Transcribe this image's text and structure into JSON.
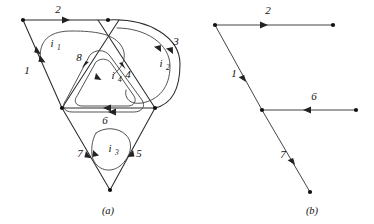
{
  "figure": {
    "panels": [
      {
        "id": "a",
        "caption": "(a)",
        "caption_x": 108,
        "caption_y": 214
      },
      {
        "id": "b",
        "caption": "(b)",
        "caption_x": 312,
        "caption_y": 214
      }
    ],
    "colors": {
      "edge": "#2b2b2b",
      "loop": "#4a4a4a",
      "node": "#111111",
      "arrow": "#222222",
      "label": "#111111",
      "background": "#ffffff"
    }
  },
  "panel_a": {
    "branch_labels": [
      {
        "name": "branch-label-2",
        "text": "2",
        "x": 58,
        "y": 13
      },
      {
        "name": "branch-label-1",
        "text": "1",
        "x": 27,
        "y": 74
      },
      {
        "name": "branch-label-8",
        "text": "8",
        "x": 79,
        "y": 61
      },
      {
        "name": "branch-label-4",
        "text": "4",
        "x": 128,
        "y": 78
      },
      {
        "name": "branch-label-3",
        "text": "3",
        "x": 176,
        "y": 45
      },
      {
        "name": "branch-label-6",
        "text": "6",
        "x": 105,
        "y": 124
      },
      {
        "name": "branch-label-7",
        "text": "7",
        "x": 80,
        "y": 157
      },
      {
        "name": "branch-label-5",
        "text": "5",
        "x": 139,
        "y": 157
      }
    ],
    "mesh_labels": [
      {
        "name": "mesh-label-i1",
        "base": "i",
        "sub": "1",
        "x": 52,
        "y": 47
      },
      {
        "name": "mesh-label-i2",
        "base": "i",
        "sub": "2",
        "x": 161,
        "y": 67
      },
      {
        "name": "mesh-label-i3",
        "base": "i",
        "sub": "3",
        "x": 110,
        "y": 152
      },
      {
        "name": "mesh-label-i4",
        "base": "i",
        "sub": "4",
        "x": 113,
        "y": 79
      }
    ],
    "nodes": [
      {
        "name": "node-top-left",
        "x": 23,
        "y": 20
      },
      {
        "name": "node-top-center",
        "x": 108,
        "y": 20
      },
      {
        "name": "node-bottom-left",
        "x": 62,
        "y": 108
      },
      {
        "name": "node-bottom-right",
        "x": 155,
        "y": 108
      },
      {
        "name": "node-bottom-apex",
        "x": 110,
        "y": 190
      }
    ]
  },
  "panel_b": {
    "branch_labels": [
      {
        "name": "branch-label-b2",
        "text": "2",
        "x": 268,
        "y": 14
      },
      {
        "name": "branch-label-b1",
        "text": "1",
        "x": 234,
        "y": 77
      },
      {
        "name": "branch-label-b6",
        "text": "6",
        "x": 314,
        "y": 100
      },
      {
        "name": "branch-label-b7",
        "text": "7",
        "x": 283,
        "y": 158
      }
    ],
    "nodes": [
      {
        "name": "node-b-top-left",
        "x": 215,
        "y": 25
      },
      {
        "name": "node-b-top-right",
        "x": 333,
        "y": 25
      },
      {
        "name": "node-b-middle",
        "x": 262,
        "y": 110
      },
      {
        "name": "node-b-right",
        "x": 356,
        "y": 110
      },
      {
        "name": "node-b-bottom",
        "x": 310,
        "y": 192
      }
    ]
  }
}
